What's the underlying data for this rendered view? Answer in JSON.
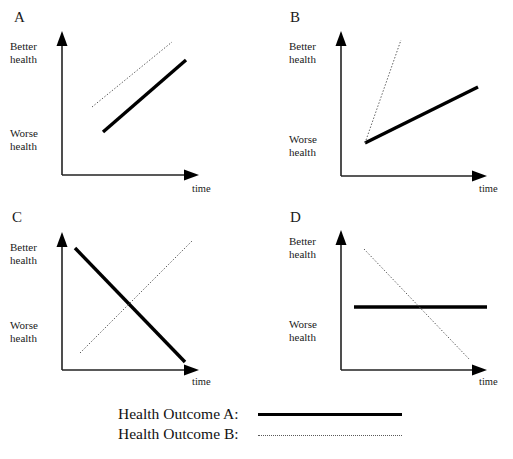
{
  "figure": {
    "background_color": "#ffffff",
    "line_color_solid": "#000000",
    "line_color_dotted": "#5a5a5a",
    "axis_color": "#222222"
  },
  "panels": [
    {
      "letter": "A",
      "y_axis_top_label": "Better\nhealth",
      "y_axis_bottom_label": "Worse\nhealth",
      "x_axis_label": "time",
      "series": [
        {
          "name": "Health Outcome A",
          "style": "solid",
          "description": "increasing",
          "x1": 41,
          "y1": 112,
          "x2": 124,
          "y2": 40
        },
        {
          "name": "Health Outcome B",
          "style": "dotted",
          "description": "increasing, higher level",
          "x1": 30,
          "y1": 87,
          "x2": 110,
          "y2": 22
        }
      ]
    },
    {
      "letter": "B",
      "y_axis_top_label": "Better\nhealth",
      "y_axis_bottom_label": "Worse\nhealth",
      "x_axis_label": "time",
      "series": [
        {
          "name": "Health Outcome A",
          "style": "solid",
          "description": "increasing, shallow slope",
          "x1": 24,
          "y1": 123,
          "x2": 137,
          "y2": 67
        },
        {
          "name": "Health Outcome B",
          "style": "dotted",
          "description": "increasing, steep slope",
          "x1": 24,
          "y1": 123,
          "x2": 60,
          "y2": 20
        }
      ]
    },
    {
      "letter": "C",
      "y_axis_top_label": "Better\nhealth",
      "y_axis_bottom_label": "Worse\nhealth",
      "x_axis_label": "time",
      "series": [
        {
          "name": "Health Outcome A",
          "style": "solid",
          "description": "decreasing",
          "x1": 13,
          "y1": 23,
          "x2": 123,
          "y2": 137
        },
        {
          "name": "Health Outcome B",
          "style": "dotted",
          "description": "increasing",
          "x1": 18,
          "y1": 128,
          "x2": 131,
          "y2": 15
        }
      ]
    },
    {
      "letter": "D",
      "y_axis_top_label": "Better\nhealth",
      "y_axis_bottom_label": "Worse\nhealth",
      "x_axis_label": "time",
      "series": [
        {
          "name": "Health Outcome A",
          "style": "solid",
          "description": "flat / no change",
          "x1": 13,
          "y1": 82,
          "x2": 146,
          "y2": 82
        },
        {
          "name": "Health Outcome B",
          "style": "dotted",
          "description": "decreasing",
          "x1": 23,
          "y1": 24,
          "x2": 129,
          "y2": 135
        }
      ]
    }
  ],
  "legend": {
    "rows": [
      {
        "label": "Health Outcome A:",
        "style": "solid"
      },
      {
        "label": "Health Outcome B:",
        "style": "dotted"
      }
    ]
  }
}
